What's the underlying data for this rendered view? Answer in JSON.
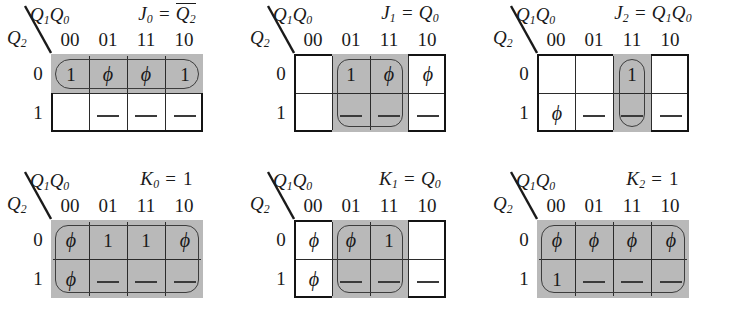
{
  "figure": {
    "axis_top_label": "Q1Q0",
    "axis_side_label": "Q2",
    "column_headers": [
      "00",
      "01",
      "11",
      "10"
    ],
    "row_labels": [
      "0",
      "1"
    ],
    "shade_color": "#b9b9b9",
    "line_color": "#2b2b2b",
    "border_color": "#141414"
  },
  "maps": [
    {
      "id": "j0",
      "title_var": "J",
      "title_sub": "0",
      "title_rhs": "Q2",
      "title_overbar": true,
      "title_plain": "J0 = Q2bar",
      "cells": [
        [
          "1",
          "ϕ",
          "ϕ",
          "1"
        ],
        [
          "",
          "—",
          "—",
          "—"
        ]
      ],
      "grouping": "top-row-all-four-cells-oval"
    },
    {
      "id": "j1",
      "title_var": "J",
      "title_sub": "1",
      "title_rhs": "Q0",
      "title_overbar": false,
      "title_plain": "J1 = Q0",
      "cells": [
        [
          "",
          "1",
          "ϕ",
          "ϕ"
        ],
        [
          "",
          "—",
          "—",
          "—"
        ]
      ],
      "grouping": "columns-01-and-11-both-rows"
    },
    {
      "id": "j2",
      "title_var": "J",
      "title_sub": "2",
      "title_rhs": "Q1Q0",
      "title_overbar": false,
      "title_plain": "J2 = Q1Q0",
      "cells": [
        [
          "",
          "",
          "1",
          ""
        ],
        [
          "ϕ",
          "—",
          "—",
          "—"
        ]
      ],
      "grouping": "column-11-both-rows-oval"
    },
    {
      "id": "k0",
      "title_var": "K",
      "title_sub": "0",
      "title_rhs": "1",
      "title_overbar": false,
      "title_plain": "K0 = 1",
      "cells": [
        [
          "ϕ",
          "1",
          "1",
          "ϕ"
        ],
        [
          "ϕ",
          "—",
          "—",
          "—"
        ]
      ],
      "grouping": "all-eight-cells"
    },
    {
      "id": "k1",
      "title_var": "K",
      "title_sub": "1",
      "title_rhs": "Q0",
      "title_overbar": false,
      "title_plain": "K1 = Q0",
      "cells": [
        [
          "ϕ",
          "ϕ",
          "1",
          ""
        ],
        [
          "ϕ",
          "—",
          "—",
          "—"
        ]
      ],
      "grouping": "columns-01-and-11-both-rows"
    },
    {
      "id": "k2",
      "title_var": "K",
      "title_sub": "2",
      "title_rhs": "1",
      "title_overbar": false,
      "title_plain": "K2 = 1",
      "cells": [
        [
          "ϕ",
          "ϕ",
          "ϕ",
          "ϕ"
        ],
        [
          "1",
          "—",
          "—",
          "—"
        ]
      ],
      "grouping": "all-eight-cells"
    }
  ]
}
